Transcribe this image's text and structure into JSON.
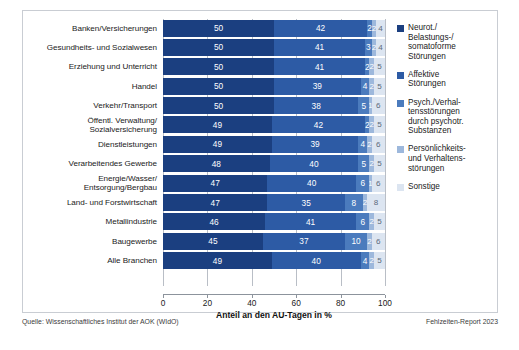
{
  "chart_data": {
    "type": "bar",
    "orientation": "horizontal",
    "stacked": true,
    "title": "",
    "xlabel": "Anteil an den AU-Tagen in %",
    "ylabel": "",
    "xlim": [
      0,
      100
    ],
    "xticks": [
      0,
      20,
      40,
      60,
      80,
      100
    ],
    "grid": true,
    "legend_position": "right",
    "categories": [
      "Banken/Versicherungen",
      "Gesundheits- und Sozialwesen",
      "Erziehung und Unterricht",
      "Handel",
      "Verkehr/Transport",
      "Öffentl. Verwaltung/ Sozialversicherung",
      "Dienstleistungen",
      "Verarbeitendes Gewerbe",
      "Energie/Wasser/ Entsorgung/Bergbau",
      "Land- und Forstwirtschaft",
      "Metallindustrie",
      "Baugewerbe",
      "Alle Branchen"
    ],
    "series": [
      {
        "name": "Neurot./Belastungs-/somatoforme Störungen",
        "color": "#1b3f80",
        "values": [
          50,
          50,
          50,
          50,
          50,
          49,
          49,
          48,
          47,
          47,
          46,
          45,
          49
        ]
      },
      {
        "name": "Affektive Störungen",
        "color": "#2d5ba5",
        "values": [
          42,
          41,
          41,
          39,
          38,
          42,
          39,
          40,
          40,
          35,
          41,
          37,
          40
        ]
      },
      {
        "name": "Psych./Verhaltensstörungen durch psychotr. Substanzen",
        "color": "#4b7bbd",
        "values": [
          2,
          3,
          2,
          4,
          5,
          2,
          4,
          5,
          6,
          8,
          6,
          10,
          4
        ]
      },
      {
        "name": "Persönlichkeits- und Verhaltensstörungen",
        "color": "#9db8dc",
        "values": [
          2,
          2,
          2,
          2,
          1,
          2,
          2,
          2,
          1,
          2,
          2,
          2,
          2
        ]
      },
      {
        "name": "Sonstige",
        "color": "#dce5f1",
        "values": [
          4,
          4,
          5,
          5,
          6,
          5,
          6,
          5,
          6,
          8,
          5,
          6,
          5
        ]
      }
    ]
  },
  "rows": [
    {
      "label_line1": "Banken/Versicherungen",
      "label_line2": "",
      "segments": [
        50,
        42,
        2,
        2,
        4
      ]
    },
    {
      "label_line1": "Gesundheits- und Sozialwesen",
      "label_line2": "",
      "segments": [
        50,
        41,
        3,
        2,
        4
      ]
    },
    {
      "label_line1": "Erziehung und Unterricht",
      "label_line2": "",
      "segments": [
        50,
        41,
        2,
        2,
        5
      ]
    },
    {
      "label_line1": "Handel",
      "label_line2": "",
      "segments": [
        50,
        39,
        4,
        2,
        5
      ]
    },
    {
      "label_line1": "Verkehr/Transport",
      "label_line2": "",
      "segments": [
        50,
        38,
        5,
        1,
        6
      ]
    },
    {
      "label_line1": "Öffentl. Verwaltung/",
      "label_line2": "Sozialversicherung",
      "segments": [
        49,
        42,
        2,
        2,
        5
      ]
    },
    {
      "label_line1": "Dienstleistungen",
      "label_line2": "",
      "segments": [
        49,
        39,
        4,
        2,
        6
      ]
    },
    {
      "label_line1": "Verarbeitendes Gewerbe",
      "label_line2": "",
      "segments": [
        48,
        40,
        5,
        2,
        5
      ]
    },
    {
      "label_line1": "Energie/Wasser/",
      "label_line2": "Entsorgung/Bergbau",
      "segments": [
        47,
        40,
        6,
        1,
        6
      ]
    },
    {
      "label_line1": "Land- und Forstwirtschaft",
      "label_line2": "",
      "segments": [
        47,
        35,
        8,
        2,
        8
      ]
    },
    {
      "label_line1": "Metallindustrie",
      "label_line2": "",
      "segments": [
        46,
        41,
        6,
        2,
        5
      ]
    },
    {
      "label_line1": "Baugewerbe",
      "label_line2": "",
      "segments": [
        45,
        37,
        10,
        2,
        6
      ]
    },
    {
      "label_line1": "Alle Branchen",
      "label_line2": "",
      "segments": [
        49,
        40,
        4,
        2,
        5
      ]
    }
  ],
  "axis": {
    "ticks": [
      "0",
      "20",
      "40",
      "60",
      "80",
      "100"
    ],
    "title": "Anteil an den AU-Tagen in %"
  },
  "legend": {
    "items": [
      {
        "color": "#1b3f80",
        "lines": [
          "Neurot./",
          "Belastungs-/",
          "somatoforme",
          "Störungen"
        ]
      },
      {
        "color": "#2d5ba5",
        "lines": [
          "Affektive",
          "Störungen"
        ]
      },
      {
        "color": "#4b7bbd",
        "lines": [
          "Psych./Verhal-",
          "tensstörungen",
          "durch psychotr.",
          "Substanzen"
        ]
      },
      {
        "color": "#9db8dc",
        "lines": [
          "Persönlichkeits-",
          "und Verhaltens-",
          "störungen"
        ]
      },
      {
        "color": "#dce5f1",
        "lines": [
          "Sonstige"
        ]
      }
    ]
  },
  "footer": {
    "source": "Quelle: Wissenschaftliches Institut der AOK (WIdO)",
    "report": "Fehlzeiten-Report 2023"
  }
}
